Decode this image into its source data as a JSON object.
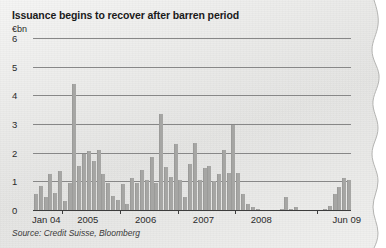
{
  "chart_data": {
    "type": "bar",
    "title": "Issuance begins to recover after barren period",
    "ylabel": "€bn",
    "xlabel": "",
    "source": "Source: Credit Suisse, Bloomberg",
    "ylim": [
      0,
      6
    ],
    "yticks": [
      0,
      1,
      2,
      3,
      4,
      5,
      6
    ],
    "ytick_labels": [
      "0",
      "1",
      "2",
      "3",
      "4",
      "5",
      "6"
    ],
    "grid": true,
    "legend": "none",
    "xtick_labels": [
      "Jan 04",
      "2005",
      "2006",
      "2007",
      "2008",
      "Jun 09"
    ],
    "xtick_positions": [
      0,
      12,
      24,
      36,
      48,
      65
    ],
    "bar_color": "#a6a6a4",
    "categories": [
      "Jan 04",
      "Feb 04",
      "Mar 04",
      "Apr 04",
      "May 04",
      "Jun 04",
      "Jul 04",
      "Aug 04",
      "Sep 04",
      "Oct 04",
      "Nov 04",
      "Dec 04",
      "Jan 05",
      "Feb 05",
      "Mar 05",
      "Apr 05",
      "May 05",
      "Jun 05",
      "Jul 05",
      "Aug 05",
      "Sep 05",
      "Oct 05",
      "Nov 05",
      "Dec 05",
      "Jan 06",
      "Feb 06",
      "Mar 06",
      "Apr 06",
      "May 06",
      "Jun 06",
      "Jul 06",
      "Aug 06",
      "Sep 06",
      "Oct 06",
      "Nov 06",
      "Dec 06",
      "Jan 07",
      "Feb 07",
      "Mar 07",
      "Apr 07",
      "May 07",
      "Jun 07",
      "Jul 07",
      "Aug 07",
      "Sep 07",
      "Oct 07",
      "Nov 07",
      "Dec 07",
      "Jan 08",
      "Feb 08",
      "Mar 08",
      "Apr 08",
      "May 08",
      "Jun 08",
      "Jul 08",
      "Aug 08",
      "Sep 08",
      "Oct 08",
      "Nov 08",
      "Dec 08",
      "Jan 09",
      "Feb 09",
      "Mar 09",
      "Apr 09",
      "May 09",
      "Jun 09"
    ],
    "values": [
      0.55,
      0.85,
      0.45,
      1.25,
      0.6,
      1.35,
      0.3,
      0.95,
      4.4,
      1.55,
      1.95,
      2.05,
      1.7,
      2.1,
      1.25,
      0.95,
      0.5,
      0.35,
      0.9,
      0.2,
      1.1,
      0.95,
      1.4,
      1.05,
      1.85,
      0.95,
      3.35,
      1.5,
      1.15,
      2.3,
      1.05,
      0.45,
      1.6,
      2.35,
      1.05,
      1.45,
      1.55,
      1.0,
      1.25,
      2.1,
      1.3,
      2.95,
      1.3,
      0.55,
      0.2,
      0.1,
      0.05,
      0.0,
      0.0,
      0.0,
      0.0,
      0.05,
      0.45,
      0.05,
      0.1,
      0.0,
      0.0,
      0.0,
      0.0,
      0.0,
      0.05,
      0.15,
      0.55,
      0.8,
      1.1,
      1.05
    ]
  }
}
